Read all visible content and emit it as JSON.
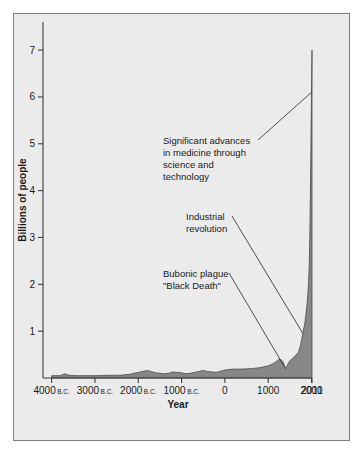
{
  "chart_data": {
    "type": "area",
    "title": "",
    "xlabel": "Year",
    "ylabel": "Billions of people",
    "xlim": [
      -4200,
      2011
    ],
    "ylim": [
      0,
      7.6
    ],
    "grid": false,
    "legend": "none",
    "x_tick_values": [
      -4000,
      -3000,
      -2000,
      -1000,
      0,
      1000,
      2000,
      2011
    ],
    "x_tick_labels": [
      {
        "number": "4000",
        "era": "B.C."
      },
      {
        "number": "3000",
        "era": "B.C."
      },
      {
        "number": "2000",
        "era": "B.C."
      },
      {
        "number": "1000",
        "era": "B.C."
      },
      {
        "number": "0",
        "era": ""
      },
      {
        "number": "1000",
        "era": ""
      },
      {
        "number": "2000",
        "era": ""
      },
      {
        "number": "2011",
        "era": ""
      }
    ],
    "y_tick_values": [
      1,
      2,
      3,
      4,
      5,
      6,
      7
    ],
    "y_tick_labels": [
      "1",
      "2",
      "3",
      "4",
      "5",
      "6",
      "7"
    ],
    "series": [
      {
        "name": "World population",
        "x": [
          -4000,
          -3800,
          -3700,
          -3600,
          -3400,
          -3000,
          -2600,
          -2400,
          -2200,
          -2000,
          -1800,
          -1700,
          -1600,
          -1400,
          -1300,
          -1200,
          -1000,
          -900,
          -800,
          -600,
          -500,
          -400,
          -200,
          0,
          200,
          400,
          600,
          800,
          900,
          1000,
          1100,
          1200,
          1250,
          1300,
          1340,
          1400,
          1450,
          1500,
          1600,
          1700,
          1750,
          1800,
          1850,
          1900,
          1930,
          1950,
          1960,
          1970,
          1980,
          1990,
          2000,
          2011
        ],
        "y": [
          0.05,
          0.05,
          0.09,
          0.06,
          0.05,
          0.05,
          0.06,
          0.06,
          0.08,
          0.12,
          0.16,
          0.14,
          0.11,
          0.09,
          0.1,
          0.13,
          0.11,
          0.09,
          0.1,
          0.14,
          0.16,
          0.14,
          0.12,
          0.17,
          0.19,
          0.19,
          0.2,
          0.22,
          0.24,
          0.26,
          0.3,
          0.36,
          0.4,
          0.39,
          0.35,
          0.2,
          0.29,
          0.37,
          0.45,
          0.55,
          0.72,
          0.95,
          1.2,
          1.6,
          2.0,
          2.5,
          3.0,
          3.7,
          4.4,
          5.3,
          6.1,
          7.0
        ]
      }
    ],
    "annotations": [
      {
        "id": "advances-in-medicine",
        "lines": [
          "Significant advances",
          "in medicine through",
          "science and",
          "technology"
        ],
        "points_to_year": 2000,
        "points_to_value": 6.1
      },
      {
        "id": "industrial-revolution",
        "lines": [
          "Industrial",
          "revolution"
        ],
        "points_to_year": 1800,
        "points_to_value": 0.95
      },
      {
        "id": "bubonic-plague",
        "lines": [
          "Bubonic plague",
          "\"Black Death\""
        ],
        "points_to_year": 1400,
        "points_to_value": 0.2
      }
    ]
  },
  "colors": {
    "background": "#ebebeb",
    "page": "#ffffff",
    "area_fill": "#878787",
    "area_stroke": "#4a4a4a",
    "axis": "#3c3c3c",
    "text": "#1a1a1a",
    "frame": "#7d7d7d"
  }
}
